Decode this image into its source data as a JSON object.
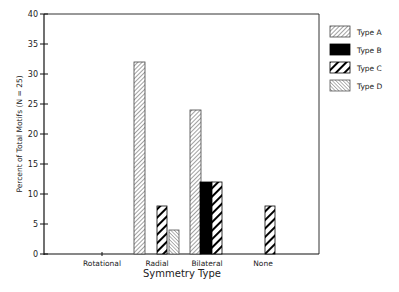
{
  "chart_data": {
    "type": "bar",
    "title": "",
    "xlabel": "Symmetry Type",
    "ylabel": "Percent of Total Motifs (N = 25)",
    "ylim": [
      0,
      40
    ],
    "yticks": [
      0,
      5,
      10,
      15,
      20,
      25,
      30,
      35,
      40
    ],
    "categories": [
      "Rotational",
      "Radial",
      "Bilateral",
      "None"
    ],
    "series": [
      {
        "name": "Type A",
        "pattern": "fine-diagonal-hatch",
        "values": [
          0,
          32,
          24,
          0
        ]
      },
      {
        "name": "Type B",
        "pattern": "solid-black",
        "values": [
          0,
          0,
          12,
          0
        ]
      },
      {
        "name": "Type C",
        "pattern": "bold-diagonal-stripes",
        "values": [
          0,
          8,
          12,
          8
        ]
      },
      {
        "name": "Type D",
        "pattern": "fine-reverse-hatch",
        "values": [
          0,
          4,
          0,
          0
        ]
      }
    ],
    "grid": false,
    "legend_position": "right"
  },
  "axis": {
    "y_title": "Percent of Total Motifs (N = 25)",
    "x_title": "Symmetry Type",
    "y_ticks": [
      "0",
      "5",
      "10",
      "15",
      "20",
      "25",
      "30",
      "35",
      "40"
    ],
    "categories": [
      "Rotational",
      "Radial",
      "Bilateral",
      "None"
    ]
  },
  "legend": {
    "items": [
      {
        "label": "Type A"
      },
      {
        "label": "Type B"
      },
      {
        "label": "Type C"
      },
      {
        "label": "Type D"
      }
    ]
  }
}
